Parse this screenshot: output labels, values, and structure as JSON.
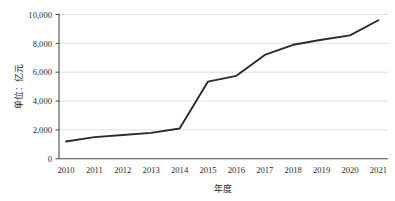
{
  "chart_data": {
    "type": "line",
    "title": "",
    "subtitle": "",
    "xlabel": "年度",
    "ylabel": "单位：亿元",
    "categories": [
      "2010",
      "2011",
      "2012",
      "2013",
      "2014",
      "2015",
      "2016",
      "2017",
      "2018",
      "2019",
      "2020",
      "2021"
    ],
    "x": [
      2010,
      2011,
      2012,
      2013,
      2014,
      2015,
      2016,
      2017,
      2018,
      2019,
      2020,
      2021
    ],
    "series": [
      {
        "name": "",
        "values": [
          1200,
          1500,
          1650,
          1800,
          2100,
          5350,
          5750,
          7200,
          7900,
          8250,
          8550,
          9600
        ]
      }
    ],
    "values": [
      1200,
      1500,
      1650,
      1800,
      2100,
      5350,
      5750,
      7200,
      7900,
      8250,
      8550,
      9600
    ],
    "ylim": [
      0,
      10000
    ],
    "yticks": [
      0,
      2000,
      4000,
      6000,
      8000,
      10000
    ],
    "ytick_labels": [
      "0",
      "2,000",
      "4,000",
      "6,000",
      "8,000",
      "10,000"
    ],
    "xtick_labels": [
      "2010",
      "2011",
      "2012",
      "2013",
      "2014",
      "2015",
      "2016",
      "2017",
      "2018",
      "2019",
      "2020",
      "2021"
    ],
    "grid": true,
    "grid_axis": "y",
    "legend": false,
    "legend_position": "none",
    "line_color": "#2b2b2b",
    "grid_color": "#d8d8d8",
    "axis_color": "#4a4a4a",
    "background_color": "#ffffff",
    "annotations": []
  }
}
